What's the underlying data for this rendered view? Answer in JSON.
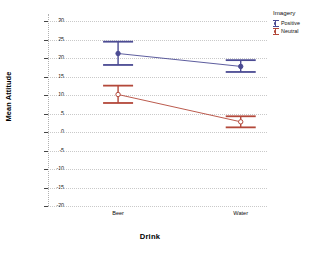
{
  "chart_data": {
    "type": "line",
    "title": "",
    "subtitle": "",
    "xlabel": "Drink",
    "ylabel": "Mean Attitude",
    "categories": [
      "Beer",
      "Water"
    ],
    "ylim": [
      -20,
      32
    ],
    "yticks": [
      30,
      25,
      20,
      15,
      10,
      5,
      0,
      -5,
      -10,
      -15,
      -20
    ],
    "ytick_labels": [
      "30",
      "25",
      "20",
      "15",
      "10",
      "5",
      "0",
      "-5",
      "-10",
      "-15",
      "-20"
    ],
    "grid": true,
    "grid_axis": "y",
    "legend_position": "right-top",
    "legend_title": "Imagery",
    "error_bar_type": "95% CI",
    "series": [
      {
        "name": "Positive",
        "color": "#4b4b93",
        "values": [
          21.3,
          17.8
        ],
        "err_low": [
          18.2,
          16.3
        ],
        "err_high": [
          24.5,
          19.5
        ]
      },
      {
        "name": "Neutral",
        "color": "#b3483a",
        "values": [
          10.2,
          2.8
        ],
        "err_low": [
          7.9,
          1.3
        ],
        "err_high": [
          12.6,
          4.3
        ]
      }
    ]
  },
  "axes": {
    "x_title": "Drink",
    "y_title": "Mean Attitude"
  },
  "legend": {
    "title": "Imagery",
    "entries": [
      {
        "label": "Positive",
        "color": "#4b4b93"
      },
      {
        "label": "Neutral",
        "color": "#b3483a"
      }
    ]
  }
}
